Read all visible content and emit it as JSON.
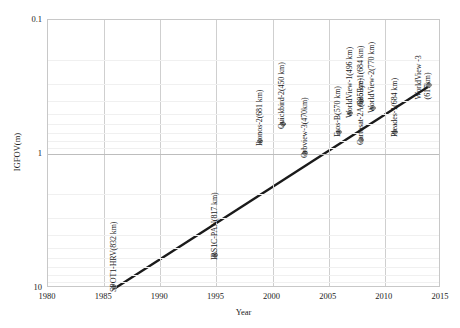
{
  "chart_data": {
    "type": "scatter",
    "title": "",
    "xlabel": "Year",
    "ylabel": "IGFOV(m)",
    "xlim": [
      1980,
      2015
    ],
    "ylim": [
      0.1,
      10
    ],
    "y_scale": "log",
    "y_inverted": true,
    "grid": true,
    "legend": "none",
    "xticks": [
      "1980",
      "1985",
      "1990",
      "1995",
      "2000",
      "2005",
      "2010",
      "2015"
    ],
    "yticks": [
      "0.1",
      "1",
      "10"
    ],
    "points": [
      {
        "label": "SPOT1-HRV(832 km)",
        "x": 1986,
        "y": 10.0
      },
      {
        "label": "IRS1C-PAN(817 km)",
        "x": 1995,
        "y": 5.8
      },
      {
        "label": "Ikonos-2(681 km)",
        "x": 1999,
        "y": 0.82
      },
      {
        "label": "Quickbird-2(450 km)",
        "x": 2001,
        "y": 0.61
      },
      {
        "label": "Orbview-3(470km)",
        "x": 2003,
        "y": 1.0
      },
      {
        "label": "Eros-B(570 km)",
        "x": 2006,
        "y": 0.7
      },
      {
        "label": "WorldView-1(496 km)",
        "x": 2007,
        "y": 0.5
      },
      {
        "label": "GeoEye-1(684 km)",
        "x": 2008,
        "y": 0.41
      },
      {
        "label": "WorldView-2(770 km)",
        "x": 2009,
        "y": 0.46
      },
      {
        "label": "Cartosat-2A(635 km)",
        "x": 2008,
        "y": 0.8
      },
      {
        "label": "Pleades-1(684 km)",
        "x": 2011,
        "y": 0.7
      },
      {
        "label": "WorldView -3\n(617km)",
        "x": 2014,
        "y": 0.31
      }
    ],
    "trend": {
      "x1": 1986,
      "y1": 10.0,
      "x2": 2014,
      "y2": 0.31
    }
  },
  "axis": {
    "x_title": "Year",
    "y_title": "IGFOV(m)"
  },
  "colors": {
    "marker": "#8a8a8a",
    "trend": "#1a1a1a",
    "grid_major": "#bdbdbd",
    "grid_minor": "#f0f0f0",
    "frame": "#c8c8c8",
    "text": "#1a1a1a"
  }
}
